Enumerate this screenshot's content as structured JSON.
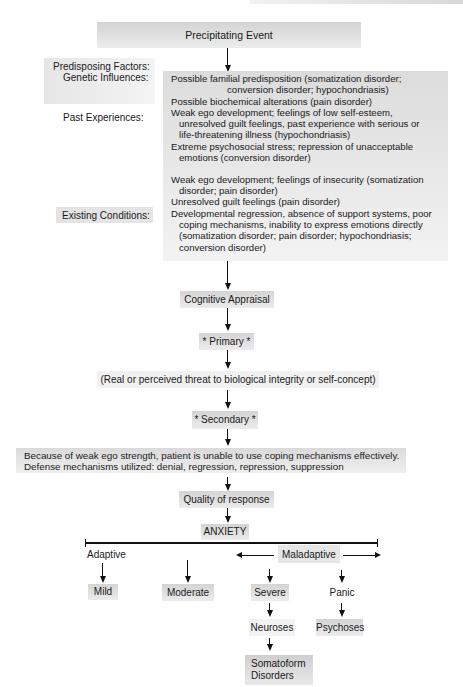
{
  "title_box": "Precipitating Event",
  "predisposing": {
    "heading": "Predisposing Factors:",
    "genetic_label": "Genetic Influences:",
    "past_label": "Past Experiences:",
    "existing_label": "Existing Conditions:",
    "lines": [
      "Possible familial predisposition (somatization disorder;",
      "conversion disorder; hypochondriasis)",
      "Possible biochemical alterations (pain disorder)",
      "Weak ego development; feelings of low self-esteem,",
      "unresolved guilt feelings, past experience with serious or",
      "life-threatening illness (hypochondriasis)",
      "Extreme psychosocial stress; repression of unacceptable",
      "emotions (conversion disorder)",
      "Weak ego development; feelings of insecurity (somatization",
      "disorder; pain disorder)",
      "Unresolved guilt feelings (pain disorder)",
      "Developmental regression, absence of support systems, poor",
      "coping mechanisms, inability to express emotions directly",
      "(somatization disorder; pain disorder; hypochondriasis;",
      "conversion disorder)"
    ]
  },
  "cognitive_appraisal": "Cognitive Appraisal",
  "primary": "* Primary *",
  "threat": "(Real or perceived threat to biological integrity or self-concept)",
  "secondary": "* Secondary *",
  "coping": {
    "line1": "Because of weak ego strength, patient is unable to use coping mechanisms effectively.",
    "line2": "Defense mechanisms utilized: denial, regression, repression, suppression"
  },
  "quality": "Quality of response",
  "anxiety": "ANXIETY",
  "adaptive": "Adaptive",
  "maladaptive": "Maladaptive",
  "levels": {
    "mild": "Mild",
    "moderate": "Moderate",
    "severe": "Severe",
    "panic": "Panic"
  },
  "neuroses": "Neuroses",
  "psychoses": "Psychoses",
  "somatoform_line1": "Somatoform",
  "somatoform_line2": "Disorders"
}
